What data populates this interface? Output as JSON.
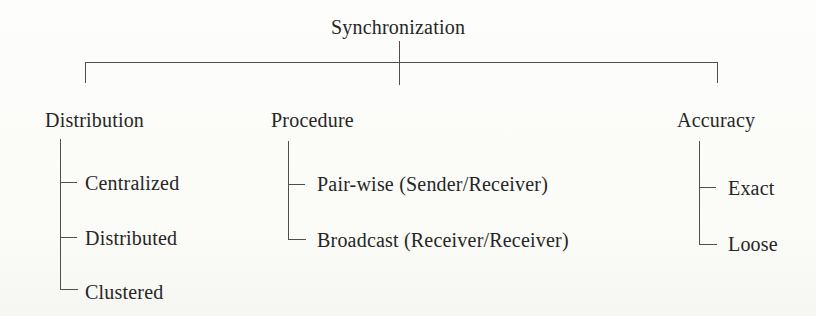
{
  "diagram": {
    "root": {
      "label": "Synchronization"
    },
    "branches": [
      {
        "label": "Distribution",
        "children": [
          {
            "label": "Centralized"
          },
          {
            "label": "Distributed"
          },
          {
            "label": "Clustered"
          }
        ]
      },
      {
        "label": "Procedure",
        "children": [
          {
            "label": "Pair-wise (Sender/Receiver)"
          },
          {
            "label": "Broadcast (Receiver/Receiver)"
          }
        ]
      },
      {
        "label": "Accuracy",
        "children": [
          {
            "label": "Exact"
          },
          {
            "label": "Loose"
          }
        ]
      }
    ],
    "colors": {
      "line": "#4f4f4f",
      "text": "#262626",
      "background": "#fbfbf8"
    }
  }
}
